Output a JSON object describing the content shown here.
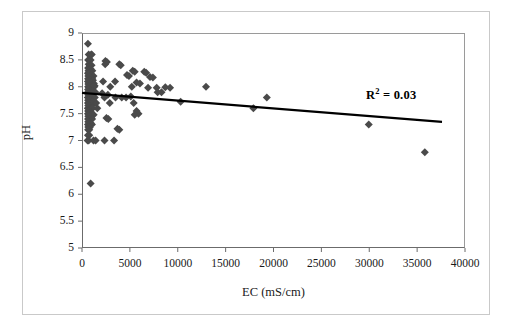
{
  "figure": {
    "background_color": "#ffffff",
    "frame_color": "#c9c9c9",
    "axis_color": "#6b6b6b"
  },
  "annotation": {
    "r2_prefix": "R",
    "r2_exponent": "2",
    "r2_value": " = 0.03"
  },
  "chart_data": {
    "type": "scatter",
    "title": "",
    "xlabel": "EC (mS/cm)",
    "ylabel": "pH",
    "xlim": [
      0,
      40000
    ],
    "ylim": [
      5,
      9
    ],
    "xticks": [
      0,
      5000,
      10000,
      15000,
      20000,
      25000,
      30000,
      35000,
      40000
    ],
    "xtick_labels": [
      "0",
      "5000",
      "10000",
      "15000",
      "20000",
      "25000",
      "30000",
      "35000",
      "40000"
    ],
    "yticks": [
      5,
      5.5,
      6,
      6.5,
      7,
      7.5,
      8,
      8.5,
      9
    ],
    "ytick_labels": [
      "5",
      "5.5",
      "6",
      "6.5",
      "7",
      "7.5",
      "8",
      "8.5",
      "9"
    ],
    "grid": false,
    "legend": false,
    "marker": {
      "shape": "diamond",
      "color": "#4a4a4a",
      "size": 4
    },
    "trendline": {
      "type": "linear",
      "color": "#000000",
      "width": 2.2,
      "x_start": 0,
      "y_start": 7.885,
      "x_end": 37600,
      "y_end": 7.345,
      "r_squared": 0.03,
      "label": "R2 = 0.03"
    },
    "series": [
      {
        "name": "pH vs EC",
        "points": [
          [
            620,
            8.8
          ],
          [
            700,
            8.6
          ],
          [
            960,
            8.6
          ],
          [
            1020,
            8.6
          ],
          [
            640,
            8.5
          ],
          [
            760,
            8.5
          ],
          [
            900,
            8.5
          ],
          [
            2450,
            8.48
          ],
          [
            2600,
            8.46
          ],
          [
            700,
            8.42
          ],
          [
            820,
            8.4
          ],
          [
            1000,
            8.4
          ],
          [
            3900,
            8.42
          ],
          [
            4050,
            8.4
          ],
          [
            640,
            8.35
          ],
          [
            780,
            8.33
          ],
          [
            900,
            8.33
          ],
          [
            1080,
            8.3
          ],
          [
            2420,
            8.42
          ],
          [
            680,
            8.3
          ],
          [
            860,
            8.28
          ],
          [
            5300,
            8.3
          ],
          [
            5500,
            8.28
          ],
          [
            620,
            8.25
          ],
          [
            740,
            8.24
          ],
          [
            960,
            8.22
          ],
          [
            1200,
            8.2
          ],
          [
            6500,
            8.28
          ],
          [
            6700,
            8.26
          ],
          [
            660,
            8.2
          ],
          [
            820,
            8.18
          ],
          [
            1060,
            8.16
          ],
          [
            4700,
            8.22
          ],
          [
            4900,
            8.2
          ],
          [
            640,
            8.15
          ],
          [
            720,
            8.14
          ],
          [
            880,
            8.12
          ],
          [
            1140,
            8.12
          ],
          [
            2200,
            8.1
          ],
          [
            7100,
            8.18
          ],
          [
            7400,
            8.17
          ],
          [
            620,
            8.1
          ],
          [
            760,
            8.09
          ],
          [
            940,
            8.08
          ],
          [
            1240,
            8.06
          ],
          [
            3450,
            8.1
          ],
          [
            660,
            8.05
          ],
          [
            840,
            8.04
          ],
          [
            1020,
            8.03
          ],
          [
            1320,
            8.02
          ],
          [
            5700,
            8.08
          ],
          [
            6050,
            8.06
          ],
          [
            640,
            8.0
          ],
          [
            700,
            8.0
          ],
          [
            780,
            8.0
          ],
          [
            880,
            8.0
          ],
          [
            980,
            8.0
          ],
          [
            1100,
            8.0
          ],
          [
            1280,
            8.0
          ],
          [
            2950,
            8.0
          ],
          [
            5200,
            8.0
          ],
          [
            6900,
            7.98
          ],
          [
            7800,
            7.98
          ],
          [
            8700,
            7.99
          ],
          [
            9200,
            7.98
          ],
          [
            12950,
            8.0
          ],
          [
            630,
            7.95
          ],
          [
            760,
            7.94
          ],
          [
            900,
            7.93
          ],
          [
            1080,
            7.92
          ],
          [
            1400,
            7.9
          ],
          [
            7900,
            7.9
          ],
          [
            8300,
            7.9
          ],
          [
            620,
            7.9
          ],
          [
            720,
            7.9
          ],
          [
            840,
            7.88
          ],
          [
            1000,
            7.87
          ],
          [
            1180,
            7.86
          ],
          [
            2100,
            7.88
          ],
          [
            650,
            7.85
          ],
          [
            790,
            7.84
          ],
          [
            930,
            7.83
          ],
          [
            1100,
            7.82
          ],
          [
            2700,
            7.85
          ],
          [
            610,
            7.8
          ],
          [
            700,
            7.8
          ],
          [
            800,
            7.8
          ],
          [
            900,
            7.8
          ],
          [
            1020,
            7.8
          ],
          [
            1160,
            7.8
          ],
          [
            1340,
            7.8
          ],
          [
            2350,
            7.8
          ],
          [
            3500,
            7.8
          ],
          [
            4150,
            7.8
          ],
          [
            4600,
            7.8
          ],
          [
            5100,
            7.82
          ],
          [
            19300,
            7.8
          ],
          [
            640,
            7.75
          ],
          [
            760,
            7.74
          ],
          [
            880,
            7.73
          ],
          [
            1050,
            7.72
          ],
          [
            620,
            7.7
          ],
          [
            720,
            7.7
          ],
          [
            840,
            7.7
          ],
          [
            980,
            7.69
          ],
          [
            1150,
            7.68
          ],
          [
            1480,
            7.7
          ],
          [
            5400,
            7.7
          ],
          [
            650,
            7.65
          ],
          [
            790,
            7.64
          ],
          [
            920,
            7.63
          ],
          [
            10300,
            7.72
          ],
          [
            610,
            7.6
          ],
          [
            700,
            7.6
          ],
          [
            820,
            7.6
          ],
          [
            950,
            7.6
          ],
          [
            1100,
            7.6
          ],
          [
            1600,
            7.6
          ],
          [
            2900,
            7.7
          ],
          [
            17900,
            7.6
          ],
          [
            640,
            7.55
          ],
          [
            760,
            7.54
          ],
          [
            900,
            7.53
          ],
          [
            5700,
            7.55
          ],
          [
            5900,
            7.5
          ],
          [
            620,
            7.5
          ],
          [
            720,
            7.5
          ],
          [
            850,
            7.5
          ],
          [
            1000,
            7.5
          ],
          [
            1220,
            7.48
          ],
          [
            5500,
            7.48
          ],
          [
            660,
            7.45
          ],
          [
            800,
            7.44
          ],
          [
            940,
            7.42
          ],
          [
            2550,
            7.42
          ],
          [
            2750,
            7.4
          ],
          [
            630,
            7.4
          ],
          [
            740,
            7.4
          ],
          [
            880,
            7.4
          ],
          [
            1060,
            7.4
          ],
          [
            650,
            7.35
          ],
          [
            790,
            7.33
          ],
          [
            930,
            7.32
          ],
          [
            620,
            7.3
          ],
          [
            740,
            7.3
          ],
          [
            880,
            7.3
          ],
          [
            1040,
            7.3
          ],
          [
            29950,
            7.3
          ],
          [
            660,
            7.25
          ],
          [
            800,
            7.24
          ],
          [
            640,
            7.2
          ],
          [
            760,
            7.2
          ],
          [
            3700,
            7.22
          ],
          [
            3900,
            7.2
          ],
          [
            620,
            7.1
          ],
          [
            760,
            7.1
          ],
          [
            580,
            7.0
          ],
          [
            700,
            7.0
          ],
          [
            1200,
            7.0
          ],
          [
            1420,
            7.0
          ],
          [
            2350,
            7.0
          ],
          [
            3350,
            7.0
          ],
          [
            900,
            6.2
          ],
          [
            35800,
            6.78
          ]
        ]
      }
    ]
  }
}
